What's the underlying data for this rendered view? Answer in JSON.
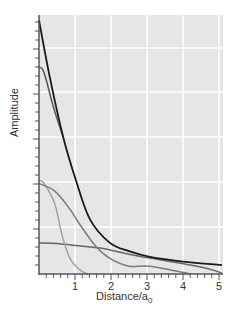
{
  "chart_data": {
    "type": "line",
    "title": "",
    "xlabel": "Distance/a",
    "xlabel_subscript": "0",
    "ylabel": "Amplitude",
    "xlim": [
      0,
      5.1
    ],
    "ylim": [
      0,
      1
    ],
    "x_ticks": [
      "1",
      "2",
      "3",
      "4",
      "5"
    ],
    "y_ticks": [],
    "grid": true,
    "legend": null,
    "colors": {
      "background": "#e6e6e6",
      "grid": "#ffffff",
      "axis": "#555555"
    },
    "series": [
      {
        "name": "curve-1 (black)",
        "color": "#1a1a1a",
        "x": [
          0,
          0.3,
          0.67,
          1.03,
          1.42,
          1.97,
          2.5,
          3.08,
          4.0,
          5.08
        ],
        "y": [
          0.98,
          0.76,
          0.53,
          0.36,
          0.21,
          0.12,
          0.088,
          0.066,
          0.048,
          0.035
        ]
      },
      {
        "name": "curve-2 (dark gray, merges into black)",
        "color": "#555555",
        "x": [
          0,
          0.1,
          0.2,
          0.35,
          0.5,
          0.67
        ],
        "y": [
          0.8,
          0.79,
          0.75,
          0.67,
          0.6,
          0.53
        ]
      },
      {
        "name": "curve-3 (medium gray)",
        "color": "#7a7a7a",
        "x": [
          0,
          0.44,
          0.86,
          1.14,
          1.56,
          1.97,
          2.5,
          3.08,
          4.2
        ],
        "y": [
          0.35,
          0.32,
          0.25,
          0.19,
          0.11,
          0.06,
          0.03,
          0.03,
          0.0
        ]
      },
      {
        "name": "curve-4 (light gray)",
        "color": "#a0a0a0",
        "x": [
          0,
          0.14,
          0.44,
          0.64,
          0.86,
          1.14,
          1.36
        ],
        "y": [
          0.36,
          0.35,
          0.27,
          0.15,
          0.06,
          0.015,
          0.0
        ]
      },
      {
        "name": "curve-5 (flat gray)",
        "color": "#666666",
        "x": [
          0,
          0.5,
          1.0,
          1.7,
          2.5,
          3.08,
          4.5,
          5.08
        ],
        "y": [
          0.12,
          0.118,
          0.11,
          0.1,
          0.076,
          0.062,
          0.027,
          0.004
        ]
      }
    ]
  }
}
